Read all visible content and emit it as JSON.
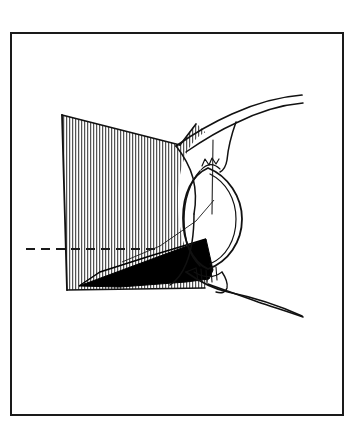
{
  "figure": {
    "domain_kind": "anatomical-line-drawing",
    "canvas": {
      "width": 350,
      "height": 426
    },
    "background_color": "#ffffff",
    "ink_color": "#111111",
    "fill_black": "#000000",
    "hatch_color": "#1a1a1a"
  },
  "frame": {
    "name": "figure-border",
    "x": 11,
    "y": 33,
    "width": 332,
    "height": 382,
    "stroke_width": 2,
    "color": "#1a1a1a",
    "fill": "#ffffff"
  },
  "axis": {
    "name": "optical-axis",
    "label": "optical axis (dashed)",
    "x1": 26,
    "y1": 249,
    "x2": 158,
    "y2": 249,
    "dash_pattern": "9 6",
    "stroke_width": 2,
    "color": "#1a1a1a"
  },
  "projection_cone": {
    "name": "visual-field-cone",
    "label": "hatched projection screen",
    "hatch_spacing_px": 3,
    "hatch_stroke_width": 1,
    "hatch_color": "#333333",
    "outline_color": "#111111",
    "outline_width": 1.6,
    "screen_polygon": "62,115 180,145 181,243 211,268 205,287 67,290",
    "upper_fan_polygon": "62,115 180,145 196,123 212,139 214,168"
  },
  "black_wedge": {
    "name": "shadow-wedge",
    "label": "solid black shadow wedge",
    "color": "#000000",
    "polygon": "79,285 206,240 213,272 185,281 104,288"
  },
  "eye": {
    "name": "eye-cross-section",
    "label": "eye globe and adnexa",
    "parts": [
      {
        "name": "upper-lid-outer-curve",
        "label": "upper eyelid outer contour"
      },
      {
        "name": "upper-lid-inner-curve",
        "label": "upper eyelid inner contour"
      },
      {
        "name": "lower-lid-outer-curve",
        "label": "lower eyelid outer contour"
      },
      {
        "name": "lower-lid-inner-curve",
        "label": "lower eyelid inner contour"
      },
      {
        "name": "globe-outline",
        "label": "eyeball globe outline"
      },
      {
        "name": "anterior-chamber",
        "label": "anterior chamber / cornea arc"
      },
      {
        "name": "lens-body",
        "label": "lens body"
      },
      {
        "name": "ciliary-apex",
        "label": "ciliary body apex detail"
      },
      {
        "name": "optic-nerve-root",
        "label": "optic nerve root detail"
      },
      {
        "name": "orbital-floor",
        "label": "orbital floor sweep"
      }
    ]
  },
  "legend": {
    "hatched_meaning": "projected visual field",
    "black_meaning": "blind sector / shadow",
    "dashed_meaning": "optical axis"
  }
}
